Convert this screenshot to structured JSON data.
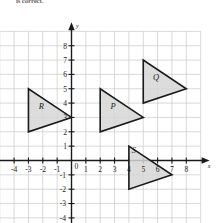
{
  "page": {
    "top_note": "is correct."
  },
  "chart_data": {
    "type": "scatter",
    "title": "",
    "xlabel": "x",
    "ylabel": "y",
    "grid": true,
    "legend": "none",
    "xlim": [
      -5,
      9
    ],
    "ylim": [
      -5,
      9
    ],
    "x_ticks": [
      -4,
      -3,
      -2,
      -1,
      1,
      2,
      3,
      4,
      5,
      6,
      7,
      8
    ],
    "y_ticks": [
      8,
      7,
      6,
      5,
      4,
      3,
      2,
      1,
      -1,
      -2,
      -3,
      -4
    ],
    "origin_label": "0",
    "x_tick_labels": [
      "-4",
      "-3",
      "-2",
      "-1",
      "1",
      "2",
      "3",
      "4",
      "5",
      "6",
      "7",
      "8"
    ],
    "y_tick_labels": [
      "8",
      "7",
      "6",
      "5",
      "4",
      "3",
      "2",
      "1",
      "-1",
      "-2",
      "-3",
      "-4"
    ],
    "axis_arrow_labels": {
      "x": "x",
      "y": "y"
    },
    "shapes": [
      {
        "name": "R",
        "label": "R",
        "label_at": [
          -2.1,
          3.6
        ],
        "vertices": [
          [
            -3,
            5
          ],
          [
            -3,
            2
          ],
          [
            0,
            3
          ]
        ]
      },
      {
        "name": "P",
        "label": "P",
        "label_at": [
          2.9,
          3.6
        ],
        "vertices": [
          [
            2,
            5
          ],
          [
            2,
            2
          ],
          [
            5,
            3
          ]
        ]
      },
      {
        "name": "Q",
        "label": "Q",
        "label_at": [
          5.9,
          5.6
        ],
        "vertices": [
          [
            5,
            7
          ],
          [
            5,
            4
          ],
          [
            8,
            5
          ]
        ]
      },
      {
        "name": "S",
        "label": "S",
        "label_at": [
          4.35,
          0.55
        ],
        "vertices": [
          [
            4,
            1
          ],
          [
            4,
            -2
          ],
          [
            7,
            -1
          ]
        ]
      }
    ],
    "colors": {
      "shape_fill": "#d6d6d6",
      "shape_stroke": "#1a1a1a",
      "grid": "#c9c9c9",
      "axis": "#1a1a1a",
      "background": "#ffffff"
    }
  }
}
